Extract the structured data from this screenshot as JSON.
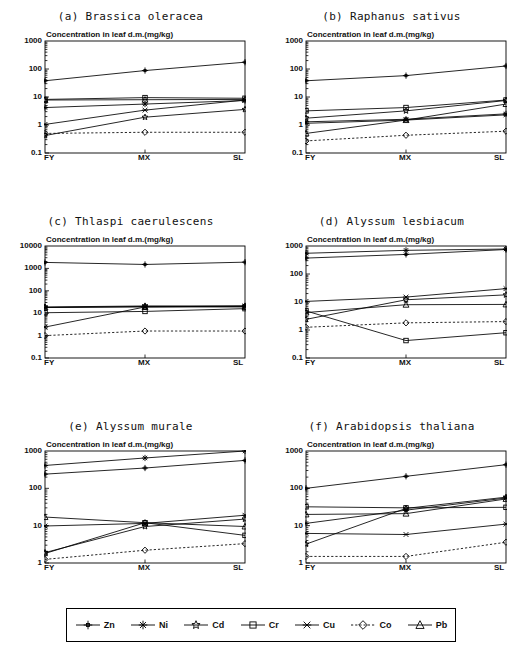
{
  "figure": {
    "xlabel": "",
    "ylabel_caption": "Concentration in leaf d.m.(mg/kg)",
    "categories": [
      "FY",
      "MX",
      "SL"
    ]
  },
  "legend": {
    "position": "bottom",
    "items": [
      {
        "name": "Zn",
        "marker": "plus-cross-marker",
        "dashed": false
      },
      {
        "name": "Ni",
        "marker": "asterisk-marker",
        "dashed": false
      },
      {
        "name": "Cd",
        "marker": "star-marker",
        "dashed": false
      },
      {
        "name": "Cr",
        "marker": "square-marker",
        "dashed": false
      },
      {
        "name": "Cu",
        "marker": "x-cross-marker",
        "dashed": false
      },
      {
        "name": "Co",
        "marker": "diamond-marker",
        "dashed": true
      },
      {
        "name": "Pb",
        "marker": "triangle-marker",
        "dashed": false
      }
    ]
  },
  "chart_data": [
    {
      "id": "a",
      "type": "line",
      "title": "(a) Brassica oleracea",
      "xlabel": "",
      "ylabel": "Concentration in leaf d.m.(mg/kg)",
      "categories": [
        "FY",
        "MX",
        "SL"
      ],
      "yscale": "log",
      "ylim": [
        0.1,
        1000
      ],
      "yticks": [
        1000,
        100,
        10,
        1,
        0.1
      ],
      "grid": false,
      "series": [
        {
          "name": "Zn",
          "marker": "plus-cross-marker",
          "dashed": false,
          "values": [
            38,
            88,
            175
          ]
        },
        {
          "name": "Ni",
          "marker": "asterisk-marker",
          "dashed": false,
          "values": [
            4.2,
            5.6,
            7.5
          ]
        },
        {
          "name": "Cd",
          "marker": "star-marker",
          "dashed": false,
          "values": [
            0.42,
            1.9,
            3.6
          ]
        },
        {
          "name": "Cr",
          "marker": "square-marker",
          "dashed": false,
          "values": [
            8.2,
            9.5,
            9.0
          ]
        },
        {
          "name": "Cu",
          "marker": "x-cross-marker",
          "dashed": false,
          "values": [
            1.05,
            3.4,
            7.8
          ]
        },
        {
          "name": "Co",
          "marker": "diamond-marker",
          "dashed": true,
          "values": [
            0.5,
            0.55,
            0.55
          ]
        },
        {
          "name": "Pb",
          "marker": "triangle-marker",
          "dashed": false,
          "values": [
            7.8,
            8.0,
            8.2
          ]
        }
      ]
    },
    {
      "id": "b",
      "type": "line",
      "title": "(b) Raphanus sativus",
      "xlabel": "",
      "ylabel": "Concentration in leaf d.m.(mg/kg)",
      "categories": [
        "FY",
        "MX",
        "SL"
      ],
      "yscale": "log",
      "ylim": [
        0.1,
        1000
      ],
      "yticks": [
        1000,
        100,
        10,
        1,
        0.1
      ],
      "grid": false,
      "series": [
        {
          "name": "Zn",
          "marker": "plus-cross-marker",
          "dashed": false,
          "values": [
            38,
            58,
            128
          ]
        },
        {
          "name": "Ni",
          "marker": "asterisk-marker",
          "dashed": false,
          "values": [
            1.3,
            1.6,
            2.5
          ]
        },
        {
          "name": "Cd",
          "marker": "star-marker",
          "dashed": false,
          "values": [
            1.75,
            3.2,
            7.5
          ]
        },
        {
          "name": "Cr",
          "marker": "square-marker",
          "dashed": false,
          "values": [
            3.2,
            4.2,
            7.8
          ]
        },
        {
          "name": "Cu",
          "marker": "x-cross-marker",
          "dashed": false,
          "values": [
            1.15,
            1.5,
            2.3
          ]
        },
        {
          "name": "Co",
          "marker": "diamond-marker",
          "dashed": true,
          "values": [
            0.27,
            0.43,
            0.6
          ]
        },
        {
          "name": "Pb",
          "marker": "triangle-marker",
          "dashed": false,
          "values": [
            0.5,
            1.5,
            5.6
          ]
        }
      ]
    },
    {
      "id": "c",
      "type": "line",
      "title": "(c) Thlaspi caerulescens",
      "xlabel": "",
      "ylabel": "Concentration in leaf d.m.(mg/kg)",
      "categories": [
        "FY",
        "MX",
        "SL"
      ],
      "yscale": "log",
      "ylim": [
        0.1,
        10000
      ],
      "yticks": [
        10000,
        1000,
        100,
        10,
        1,
        0.1
      ],
      "grid": false,
      "series": [
        {
          "name": "Zn",
          "marker": "plus-cross-marker",
          "dashed": false,
          "values": [
            1850,
            1500,
            1900
          ]
        },
        {
          "name": "Ni",
          "marker": "asterisk-marker",
          "dashed": false,
          "values": [
            18,
            20,
            20
          ]
        },
        {
          "name": "Cd",
          "marker": "star-marker",
          "dashed": false,
          "values": [
            19,
            21,
            21
          ]
        },
        {
          "name": "Cr",
          "marker": "square-marker",
          "dashed": false,
          "values": [
            10.5,
            12,
            16
          ]
        },
        {
          "name": "Cu",
          "marker": "x-cross-marker",
          "dashed": false,
          "values": [
            2.4,
            19,
            21
          ]
        },
        {
          "name": "Co",
          "marker": "diamond-marker",
          "dashed": true,
          "values": [
            1.0,
            1.6,
            1.6
          ]
        },
        {
          "name": "Pb",
          "marker": "triangle-marker",
          "dashed": false,
          "values": [
            18,
            19,
            19
          ]
        }
      ]
    },
    {
      "id": "d",
      "type": "line",
      "title": "(d) Alyssum lesbiacum",
      "xlabel": "",
      "ylabel": "Concentration in leaf d.m.(mg/kg)",
      "categories": [
        "FY",
        "MX",
        "SL"
      ],
      "yscale": "log",
      "ylim": [
        0.1,
        1000
      ],
      "yticks": [
        1000,
        100,
        10,
        1,
        0.1
      ],
      "grid": false,
      "series": [
        {
          "name": "Zn",
          "marker": "plus-cross-marker",
          "dashed": false,
          "values": [
            370,
            500,
            750
          ]
        },
        {
          "name": "Ni",
          "marker": "asterisk-marker",
          "dashed": false,
          "values": [
            550,
            700,
            780
          ]
        },
        {
          "name": "Cd",
          "marker": "star-marker",
          "dashed": false,
          "values": [
            2.4,
            12,
            18
          ]
        },
        {
          "name": "Cr",
          "marker": "square-marker",
          "dashed": false,
          "values": [
            4.8,
            0.42,
            0.8
          ]
        },
        {
          "name": "Cu",
          "marker": "x-cross-marker",
          "dashed": false,
          "values": [
            10.5,
            15,
            30
          ]
        },
        {
          "name": "Co",
          "marker": "diamond-marker",
          "dashed": true,
          "values": [
            1.25,
            1.8,
            2.0
          ]
        },
        {
          "name": "Pb",
          "marker": "triangle-marker",
          "dashed": false,
          "values": [
            4.2,
            8.0,
            8.2
          ]
        }
      ]
    },
    {
      "id": "e",
      "type": "line",
      "title": "(e) Alyssum murale",
      "xlabel": "",
      "ylabel": "Concentration in leaf d.m.(mg/kg)",
      "categories": [
        "FY",
        "MX",
        "SL"
      ],
      "yscale": "log",
      "ylim": [
        1,
        1000
      ],
      "yticks": [
        1000,
        100,
        10,
        1
      ],
      "grid": false,
      "series": [
        {
          "name": "Zn",
          "marker": "plus-cross-marker",
          "dashed": false,
          "values": [
            240,
            350,
            560
          ]
        },
        {
          "name": "Ni",
          "marker": "asterisk-marker",
          "dashed": false,
          "values": [
            410,
            650,
            1000
          ]
        },
        {
          "name": "Cd",
          "marker": "star-marker",
          "dashed": false,
          "values": [
            1.9,
            9.5,
            15
          ]
        },
        {
          "name": "Cr",
          "marker": "square-marker",
          "dashed": false,
          "values": [
            1.8,
            12,
            5.5
          ]
        },
        {
          "name": "Cu",
          "marker": "x-cross-marker",
          "dashed": false,
          "values": [
            9.8,
            11.5,
            19
          ]
        },
        {
          "name": "Co",
          "marker": "diamond-marker",
          "dashed": true,
          "values": [
            1.25,
            2.2,
            3.3
          ]
        },
        {
          "name": "Pb",
          "marker": "triangle-marker",
          "dashed": false,
          "values": [
            17,
            12,
            9.5
          ]
        }
      ]
    },
    {
      "id": "f",
      "type": "line",
      "title": "(f) Arabidopsis thaliana",
      "xlabel": "",
      "ylabel": "Concentration in leaf d.m.(mg/kg)",
      "categories": [
        "FY",
        "MX",
        "SL"
      ],
      "yscale": "log",
      "ylim": [
        1,
        1000
      ],
      "yticks": [
        1000,
        100,
        10,
        1
      ],
      "grid": false,
      "series": [
        {
          "name": "Zn",
          "marker": "plus-cross-marker",
          "dashed": false,
          "values": [
            100,
            210,
            430
          ]
        },
        {
          "name": "Ni",
          "marker": "asterisk-marker",
          "dashed": false,
          "values": [
            11.5,
            26,
            55
          ]
        },
        {
          "name": "Cd",
          "marker": "star-marker",
          "dashed": false,
          "values": [
            3.2,
            29,
            58
          ]
        },
        {
          "name": "Cr",
          "marker": "square-marker",
          "dashed": false,
          "values": [
            32,
            30,
            31
          ]
        },
        {
          "name": "Cu",
          "marker": "x-cross-marker",
          "dashed": false,
          "values": [
            6.2,
            5.8,
            11
          ]
        },
        {
          "name": "Co",
          "marker": "diamond-marker",
          "dashed": true,
          "values": [
            1.5,
            1.5,
            3.6
          ]
        },
        {
          "name": "Pb",
          "marker": "triangle-marker",
          "dashed": false,
          "values": [
            20,
            21,
            52
          ]
        }
      ]
    }
  ]
}
